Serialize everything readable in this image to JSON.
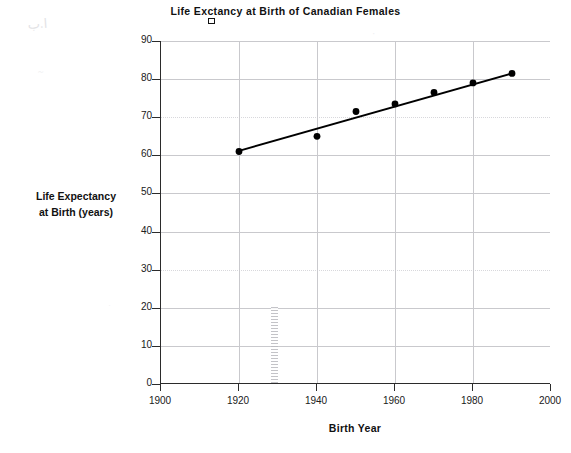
{
  "chart_data": {
    "type": "scatter",
    "xlabel": "Birth Year",
    "ylabel": "Life Expectancy at Birth (years)",
    "ylabel_line1": "Life  Expectancy",
    "ylabel_line2": "at Birth (years)",
    "title_part1": "Life Ex",
    "title_glitch": "pe",
    "title_part2": "ctancy at Birth of Canadian Females",
    "xlim": [
      1900,
      2000
    ],
    "ylim": [
      0,
      90
    ],
    "xticks": [
      1900,
      1920,
      1940,
      1960,
      1980,
      2000
    ],
    "yticks": [
      0,
      10,
      20,
      30,
      40,
      50,
      60,
      70,
      80,
      90
    ],
    "grid": true,
    "legend": "none",
    "x": [
      1920,
      1940,
      1950,
      1960,
      1970,
      1980,
      1990
    ],
    "values": [
      61,
      65,
      71.5,
      73.5,
      76.5,
      79,
      81.5
    ],
    "series": [
      {
        "name": "Life expectancy at birth",
        "x": [
          1920,
          1940,
          1950,
          1960,
          1970,
          1980,
          1990
        ],
        "values": [
          61,
          65,
          71.5,
          73.5,
          76.5,
          79,
          81.5
        ],
        "marker": "filled-circle",
        "color": "#000000"
      },
      {
        "name": "Line of best fit",
        "type": "line",
        "x": [
          1920,
          1990
        ],
        "values": [
          61.2,
          81.5
        ],
        "color": "#000000"
      }
    ],
    "marker_color": "#000000",
    "trendline_color": "#000000",
    "gridline_color": "#c9c9cd",
    "axis_color": "#2b2b2b",
    "background": "#ffffff"
  },
  "artifacts": {
    "hatch_bar_label": "scan-hatch-artifact",
    "smudge_a": "ا.ب",
    "smudge_b": "~",
    "smudge_c": "·",
    "smudge_d": "~",
    "smudge_e": "·"
  }
}
